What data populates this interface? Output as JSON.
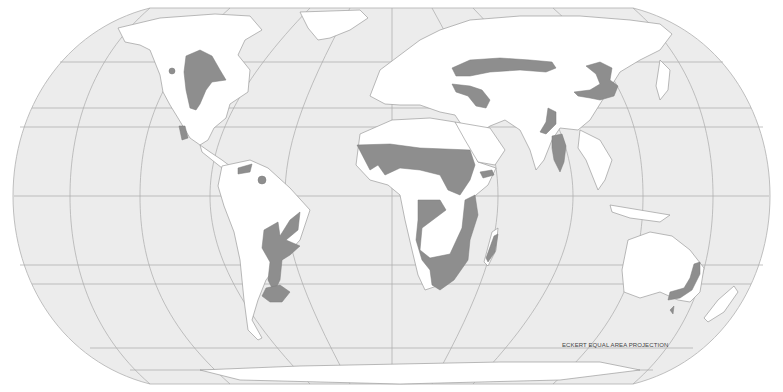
{
  "map": {
    "projection_label": "ECKERT EQUAL AREA PROJECTION",
    "type": "world map",
    "colors": {
      "ocean": "#ececec",
      "land": "#ffffff",
      "highlighted_regions": "#8e8e8e",
      "grid": "#a9a9a9"
    },
    "highlighted_regions": [
      "Central North America",
      "Western Mexico",
      "Northern South America",
      "Central/Eastern South America",
      "Pampas",
      "Sahel and West Africa",
      "Horn of Africa",
      "Southern and Central Africa",
      "Madagascar",
      "Eastern Europe / Russian Steppe",
      "Anatolia / Caucasus",
      "Central Asia / Mongolia",
      "Western India",
      "Deccan / Eastern India",
      "Eastern Australia"
    ]
  }
}
